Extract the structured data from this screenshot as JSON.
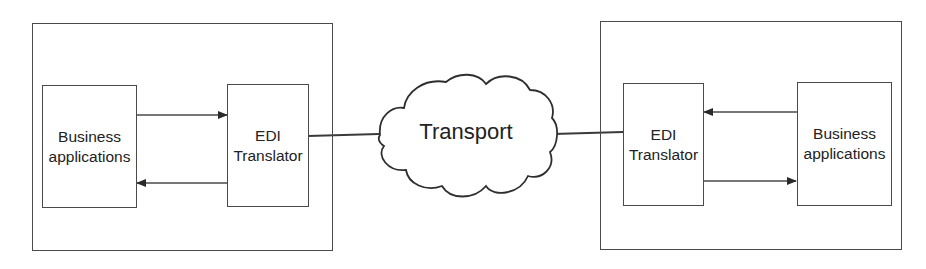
{
  "diagram": {
    "type": "EDI communication architecture",
    "left_partner": {
      "business_box": {
        "line1": "Business",
        "line2": "applications"
      },
      "translator_box": {
        "line1": "EDI",
        "line2": "Translator"
      },
      "arrows": [
        {
          "from": "Business applications",
          "to": "EDI Translator",
          "direction": "right"
        },
        {
          "from": "EDI Translator",
          "to": "Business applications",
          "direction": "left"
        }
      ]
    },
    "network": {
      "label": "Transport",
      "icon": "cloud-icon"
    },
    "right_partner": {
      "translator_box": {
        "line1": "EDI",
        "line2": "Translator"
      },
      "business_box": {
        "line1": "Business",
        "line2": "applications"
      },
      "arrows": [
        {
          "from": "Business applications",
          "to": "EDI Translator",
          "direction": "left"
        },
        {
          "from": "EDI Translator",
          "to": "Business applications",
          "direction": "right"
        }
      ]
    },
    "colors": {
      "stroke": "#4a4a4a",
      "text": "#222222",
      "background": "#ffffff"
    }
  }
}
